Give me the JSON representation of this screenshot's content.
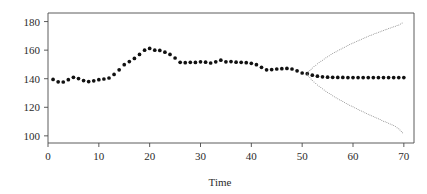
{
  "chart_data": {
    "type": "line",
    "title": "",
    "subtitle": "",
    "xlabel": "Time",
    "ylabel": "",
    "xlim": [
      0,
      72
    ],
    "ylim": [
      95,
      186
    ],
    "xticks": [
      0,
      10,
      20,
      30,
      40,
      50,
      60,
      70
    ],
    "yticks": [
      100,
      120,
      140,
      160,
      180
    ],
    "xtick_labels": [
      "0",
      "10",
      "20",
      "30",
      "40",
      "50",
      "60",
      "70"
    ],
    "ytick_labels": [
      "100",
      "120",
      "140",
      "160",
      "180"
    ],
    "grid": false,
    "legend": "none",
    "marker": "filled-circle",
    "series": [
      {
        "name": "observed",
        "style": "points",
        "color": "#111111",
        "x": [
          1,
          2,
          3,
          4,
          5,
          6,
          7,
          8,
          9,
          10,
          11,
          12,
          13,
          14,
          15,
          16,
          17,
          18,
          19,
          20,
          21,
          22,
          23,
          24,
          25,
          26,
          27,
          28,
          29,
          30,
          31,
          32,
          33,
          34,
          35,
          36,
          37,
          38,
          39,
          40,
          41,
          42,
          43,
          44,
          45,
          46,
          47,
          48,
          49,
          50,
          51
        ],
        "values": [
          139.5,
          137.8,
          137.7,
          139.3,
          141.0,
          140.1,
          138.7,
          138.0,
          138.5,
          139.3,
          139.8,
          140.5,
          143.0,
          146.2,
          149.8,
          152.0,
          154.2,
          157.0,
          160.0,
          161.2,
          160.0,
          159.8,
          158.6,
          157.0,
          154.5,
          151.5,
          151.2,
          151.5,
          151.4,
          151.8,
          151.6,
          151.0,
          151.8,
          153.0,
          151.8,
          152.0,
          151.6,
          151.5,
          151.2,
          150.8,
          149.8,
          148.0,
          146.2,
          146.4,
          146.8,
          147.0,
          147.2,
          146.8,
          145.5,
          144.0,
          143.5
        ]
      },
      {
        "name": "forecast",
        "style": "points",
        "color": "#111111",
        "x": [
          52,
          53,
          54,
          55,
          56,
          57,
          58,
          59,
          60,
          61,
          62,
          63,
          64,
          65,
          66,
          67,
          68,
          69,
          70
        ],
        "values": [
          142.5,
          141.8,
          141.3,
          141.1,
          141.0,
          140.9,
          140.9,
          140.8,
          140.8,
          140.8,
          140.8,
          140.8,
          140.8,
          140.8,
          140.8,
          140.8,
          140.8,
          140.8,
          140.8
        ]
      },
      {
        "name": "upper-bound",
        "style": "dotted",
        "color": "#8c8c8c",
        "x": [
          51,
          52,
          53,
          54,
          55,
          56,
          57,
          58,
          59,
          60,
          61,
          62,
          63,
          64,
          65,
          66,
          67,
          68,
          69,
          70
        ],
        "values": [
          144.0,
          147.5,
          150.5,
          153.0,
          155.4,
          157.6,
          159.6,
          161.5,
          163.3,
          165.0,
          166.6,
          168.2,
          169.7,
          171.1,
          172.5,
          173.8,
          175.1,
          176.4,
          177.6,
          179.8
        ]
      },
      {
        "name": "lower-bound",
        "style": "dotted",
        "color": "#8c8c8c",
        "x": [
          51,
          52,
          53,
          54,
          55,
          56,
          57,
          58,
          59,
          60,
          61,
          62,
          63,
          64,
          65,
          66,
          67,
          68,
          69,
          70
        ],
        "values": [
          143.0,
          138.8,
          135.6,
          132.9,
          130.4,
          128.1,
          126.0,
          124.0,
          122.1,
          120.3,
          118.5,
          116.8,
          115.1,
          113.5,
          111.9,
          110.3,
          108.8,
          107.2,
          105.0,
          101.2
        ]
      }
    ]
  }
}
